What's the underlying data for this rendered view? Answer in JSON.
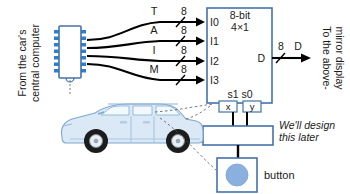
{
  "diagram": {
    "source_label_line1": "From the car's",
    "source_label_line2": "central computer",
    "chip_icon": "ic-chip-icon",
    "car_icon": "car-suv-icon",
    "inputs": [
      {
        "signal": "T",
        "width": "8",
        "port": "I0"
      },
      {
        "signal": "A",
        "width": "8",
        "port": "I1"
      },
      {
        "signal": "I",
        "width": "8",
        "port": "I2"
      },
      {
        "signal": "M",
        "width": "8",
        "port": "I3"
      }
    ],
    "mux": {
      "label_line1": "8-bit",
      "label_line2": "4×1",
      "output_port": "D",
      "select_label": "s1 s0",
      "select_bits": [
        "x",
        "y"
      ]
    },
    "output": {
      "width": "8",
      "signal": "D",
      "destination_line1": "To the above-",
      "destination_line2": "mirror display"
    },
    "annotation": {
      "line1": "We'll design",
      "line2": "this later"
    },
    "button": {
      "label": "button",
      "icon": "round-button-icon"
    },
    "colors": {
      "box_stroke": "#4472a8",
      "box_fill": "#ffffff",
      "chip_pin": "#2f7fd0",
      "button_fill": "#8ab0de",
      "car_body": "#dbe9f6",
      "wire": "#000000",
      "text": "#1a1a1a"
    }
  }
}
